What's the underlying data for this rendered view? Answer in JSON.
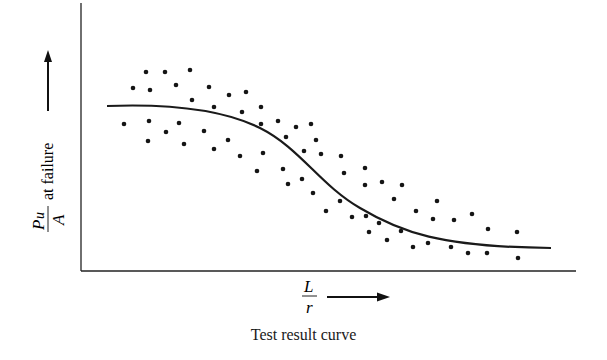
{
  "chart_data": {
    "type": "scatter",
    "title": "",
    "caption": "Test result curve",
    "xlabel": {
      "numerator": "L",
      "denominator": "r"
    },
    "ylabel": {
      "numerator": "P",
      "subscript": "u",
      "denominator": "A",
      "suffix": "at failure"
    },
    "grid": false,
    "legend": null,
    "axis_ticks": "none",
    "series": [
      {
        "name": "test points",
        "kind": "scatter",
        "points": [
          [
            146,
            72
          ],
          [
            165,
            72
          ],
          [
            190,
            70
          ],
          [
            133,
            88
          ],
          [
            150,
            90
          ],
          [
            176,
            85
          ],
          [
            209,
            87
          ],
          [
            192,
            100
          ],
          [
            214,
            107
          ],
          [
            124,
            124
          ],
          [
            149,
            121
          ],
          [
            179,
            123
          ],
          [
            166,
            132
          ],
          [
            204,
            131
          ],
          [
            148,
            141
          ],
          [
            184,
            144
          ],
          [
            214,
            149
          ],
          [
            229,
            95
          ],
          [
            246,
            92
          ],
          [
            261,
            107
          ],
          [
            242,
            112
          ],
          [
            261,
            124
          ],
          [
            278,
            121
          ],
          [
            296,
            127
          ],
          [
            311,
            124
          ],
          [
            228,
            140
          ],
          [
            286,
            137
          ],
          [
            316,
            140
          ],
          [
            240,
            156
          ],
          [
            263,
            153
          ],
          [
            304,
            151
          ],
          [
            257,
            171
          ],
          [
            283,
            169
          ],
          [
            302,
            179
          ],
          [
            288,
            184
          ],
          [
            321,
            154
          ],
          [
            341,
            156
          ],
          [
            344,
            173
          ],
          [
            365,
            168
          ],
          [
            313,
            193
          ],
          [
            365,
            185
          ],
          [
            382,
            182
          ],
          [
            402,
            185
          ],
          [
            340,
            201
          ],
          [
            394,
            199
          ],
          [
            326,
            211
          ],
          [
            352,
            217
          ],
          [
            366,
            216
          ],
          [
            379,
            223
          ],
          [
            416,
            211
          ],
          [
            369,
            232
          ],
          [
            401,
            231
          ],
          [
            387,
            240
          ],
          [
            413,
            247
          ],
          [
            437,
            201
          ],
          [
            433,
            219
          ],
          [
            454,
            220
          ],
          [
            472,
            214
          ],
          [
            488,
            229
          ],
          [
            517,
            232
          ],
          [
            428,
            243
          ],
          [
            451,
            247
          ],
          [
            468,
            253
          ],
          [
            487,
            253
          ],
          [
            518,
            258
          ]
        ]
      },
      {
        "name": "test result curve",
        "kind": "line",
        "path": "M107,106 C160,104 220,108 260,128 C300,148 320,185 360,208 C400,232 440,247 551,248"
      }
    ]
  },
  "labels": {
    "y_numerator": "P",
    "y_subscript": "u",
    "y_denominator": "A",
    "y_suffix": "at failure",
    "x_numerator": "L",
    "x_denominator": "r",
    "caption": "Test result curve"
  }
}
